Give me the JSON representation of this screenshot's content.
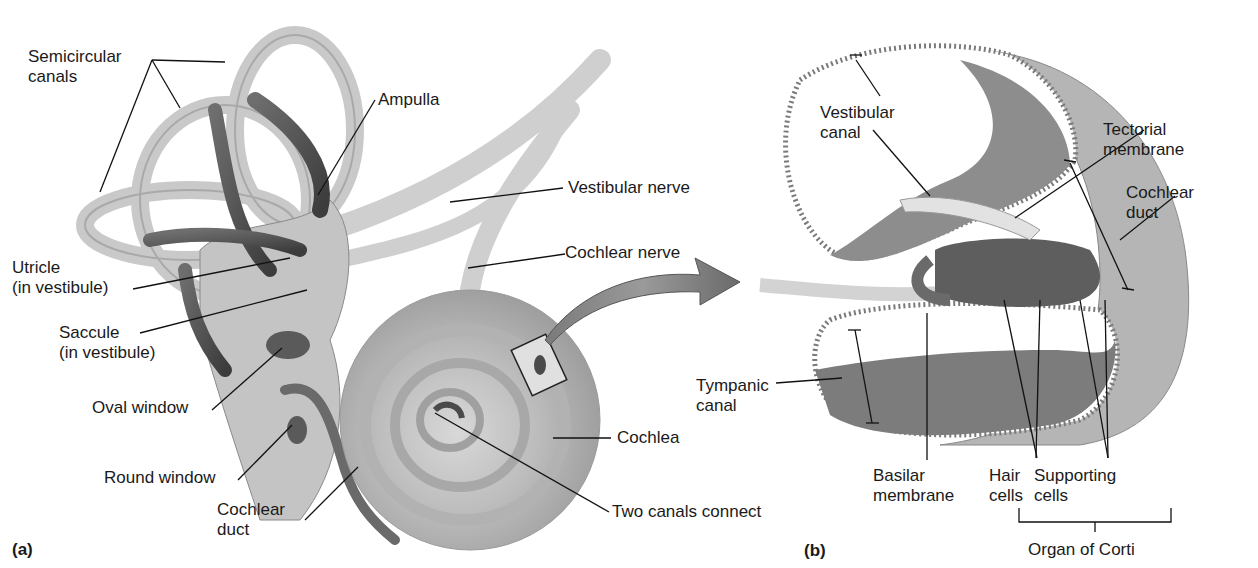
{
  "figure": {
    "panel_a": {
      "panel_label": "(a)",
      "labels": {
        "semicircular_canals": "Semicircular\ncanals",
        "ampulla": "Ampulla",
        "vestibular_nerve": "Vestibular nerve",
        "cochlear_nerve": "Cochlear nerve",
        "utricle": "Utricle\n(in vestibule)",
        "saccule": "Saccule\n(in vestibule)",
        "oval_window": "Oval window",
        "round_window": "Round window",
        "cochlear_duct": "Cochlear\nduct",
        "cochlea": "Cochlea",
        "two_canals_connect": "Two canals connect"
      }
    },
    "panel_b": {
      "panel_label": "(b)",
      "labels": {
        "vestibular_canal": "Vestibular\ncanal",
        "tectorial_membrane": "Tectorial\nmembrane",
        "cochlear_duct": "Cochlear\nduct",
        "tympanic_canal": "Tympanic\ncanal",
        "basilar_membrane": "Basilar\nmembrane",
        "hair_cells": "Hair\ncells",
        "supporting_cells": "Supporting\ncells",
        "organ_of_corti": "Organ of Corti"
      }
    }
  }
}
